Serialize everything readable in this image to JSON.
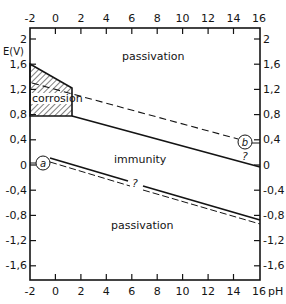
{
  "diagram": {
    "type": "pourbaix",
    "colors": {
      "ink": "#141414",
      "background": "#ffffff"
    },
    "axes": {
      "x_label": "pH",
      "y_label": "E(V)",
      "x_ticks_top": [
        "-2",
        "0",
        "2",
        "4",
        "6",
        "8",
        "10",
        "12",
        "14",
        "16"
      ],
      "x_ticks_bottom": [
        "-2",
        "0",
        "2",
        "4",
        "6",
        "8",
        "10",
        "12",
        "14",
        "16"
      ],
      "y_ticks_left": [
        "2",
        "1,6",
        "1,2",
        "0,8",
        "0,4",
        "0",
        "-0,4",
        "-0,8",
        "-1,2",
        "-1,6"
      ],
      "y_ticks_right": [
        "2",
        "1,6",
        "1,2",
        "0,8",
        "0,4",
        "0",
        "-0,4",
        "-0,8",
        "-1,2",
        "-1,6"
      ],
      "x_range": [
        -2,
        16
      ],
      "y_range": [
        -1.8,
        2.2
      ]
    },
    "regions": {
      "passivation_top": "passivation",
      "corrosion": "corrosion",
      "immunity": "immunity",
      "passivation_bottom": "passivation"
    },
    "annotations": {
      "line_a": "a",
      "line_b": "b",
      "question_mid": "?",
      "question_right": "?"
    }
  }
}
